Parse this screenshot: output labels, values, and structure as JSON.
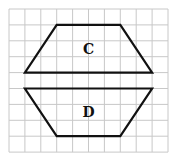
{
  "figure": {
    "grid": {
      "columns": 10,
      "rows": 9,
      "line_color": "#c8c8c8"
    },
    "shapes": [
      {
        "label": "C",
        "kind": "trapezoid",
        "vertices_grid_units": [
          [
            3,
            1
          ],
          [
            7,
            1
          ],
          [
            9,
            4
          ],
          [
            1,
            4
          ]
        ]
      },
      {
        "label": "D",
        "kind": "trapezoid",
        "vertices_grid_units": [
          [
            1,
            5
          ],
          [
            9,
            5
          ],
          [
            7,
            8
          ],
          [
            3,
            8
          ]
        ]
      }
    ],
    "stroke_color": "#111111"
  }
}
